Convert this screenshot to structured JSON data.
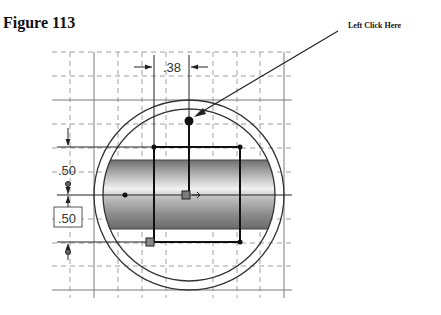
{
  "figure": {
    "title": "Figure 113",
    "callout_label": "Left Click Here"
  },
  "sketch": {
    "dimensions": {
      "horizontal": ".38",
      "vertical_upper": ".50",
      "vertical_lower": ".50"
    },
    "colors": {
      "grid_solid": "#777777",
      "grid_dashed": "#9a9a9a",
      "sketch_line": "#1a1a1a",
      "band_dark": "#7a7a7a",
      "band_light": "#f0f0f0"
    }
  }
}
